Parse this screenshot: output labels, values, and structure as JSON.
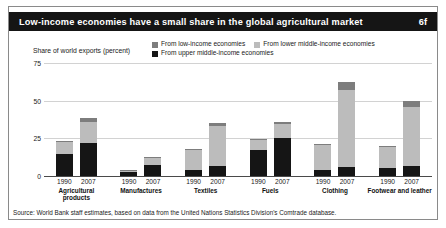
{
  "title": {
    "text": "Low-income economies have a small share in the global agricultural market",
    "number": "6f"
  },
  "axis": {
    "ylabel": "Share of world exports (percent)",
    "yticks": [
      "0",
      "25",
      "50",
      "75"
    ]
  },
  "legend": {
    "items": [
      {
        "label": "From low-income economies",
        "color": "#7d7d7d"
      },
      {
        "label": "From lower middle-income economies",
        "color": "#bcbcbc"
      },
      {
        "label": "From upper middle-income economies",
        "color": "#151515"
      }
    ]
  },
  "source": "Source: World Bank staff estimates, based on data from the United Nations Statistics Division's Comtrade database.",
  "chart_data": {
    "type": "bar",
    "subtype": "stacked-grouped",
    "title": "Low-income economies have a small share in the global agricultural market",
    "xlabel": "",
    "ylabel": "Share of world exports (percent)",
    "ylim": [
      0,
      75
    ],
    "yticks": [
      0,
      25,
      50,
      75
    ],
    "grid": true,
    "legend_position": "top-right",
    "categories": [
      "Agricultural products",
      "Manufactures",
      "Textiles",
      "Fuels",
      "Clothing",
      "Footwear and leather"
    ],
    "years": [
      "1990",
      "2007"
    ],
    "series": [
      {
        "name": "From upper middle-income economies",
        "color": "#151515",
        "values": {
          "1990": [
            14.5,
            2.5,
            4.0,
            17.0,
            4.0,
            5.5
          ],
          "2007": [
            22.0,
            7.5,
            6.5,
            25.5,
            6.0,
            6.5
          ]
        }
      },
      {
        "name": "From lower middle-income economies",
        "color": "#bcbcbc",
        "values": {
          "1990": [
            8.0,
            1.0,
            13.0,
            7.0,
            16.5,
            13.5
          ],
          "2007": [
            14.0,
            4.5,
            26.5,
            9.0,
            51.0,
            39.5
          ]
        }
      },
      {
        "name": "From low-income economies",
        "color": "#7d7d7d",
        "values": {
          "1990": [
            1.0,
            0.3,
            1.2,
            0.6,
            1.0,
            0.8
          ],
          "2007": [
            2.5,
            0.7,
            2.0,
            1.2,
            5.5,
            4.0
          ]
        }
      }
    ],
    "totals": {
      "1990": [
        23.5,
        3.8,
        18.2,
        24.6,
        21.5,
        19.8
      ],
      "2007": [
        38.5,
        12.7,
        35.0,
        35.7,
        62.5,
        50.0
      ]
    }
  }
}
